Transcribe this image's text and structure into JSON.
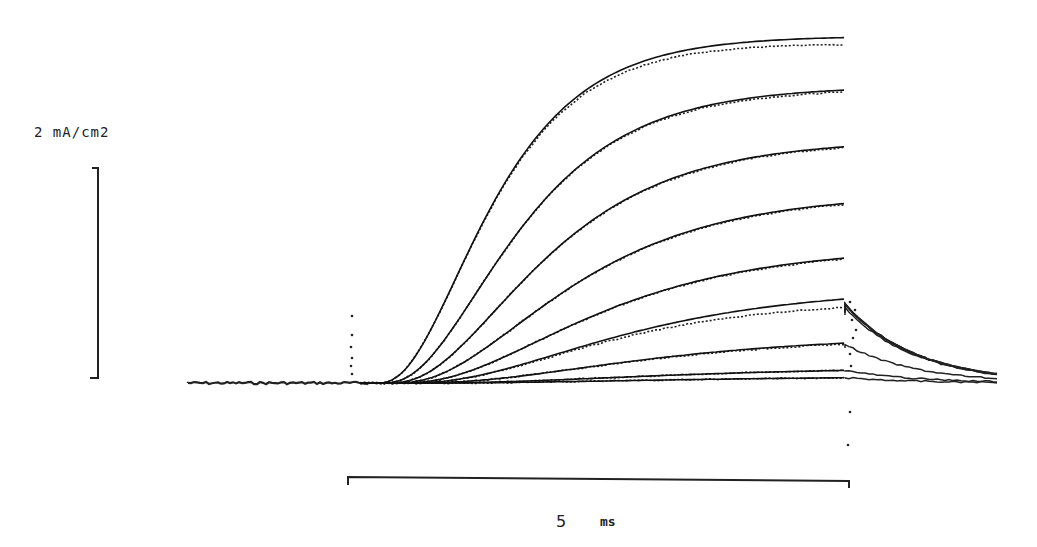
{
  "chart_data": {
    "type": "line",
    "title": "",
    "scale_bars": {
      "current": {
        "label": "2 mA/cm2",
        "value": 2,
        "unit": "mA/cm2"
      },
      "time": {
        "label": "5",
        "unit": "ms",
        "value": 5
      }
    },
    "xlabel": "time (ms)",
    "ylabel": "current (mA/cm2)",
    "xlim": [
      -1.7,
      6.4
    ],
    "ylim": [
      -0.6,
      3.4
    ],
    "step_on_ms": 0,
    "step_off_ms": 4.85,
    "series": [
      {
        "name": "trace 1",
        "final_fit": 3.29,
        "final_data": 3.22,
        "tau_ms": 1.6,
        "delay_ms": 0.15
      },
      {
        "name": "trace 2",
        "final_fit": 2.79,
        "final_data": 2.77,
        "tau_ms": 1.9,
        "delay_ms": 0.2
      },
      {
        "name": "trace 3",
        "final_fit": 2.25,
        "final_data": 2.24,
        "tau_ms": 2.2,
        "delay_ms": 0.25
      },
      {
        "name": "trace 4",
        "final_fit": 1.71,
        "final_data": 1.7,
        "tau_ms": 2.5,
        "delay_ms": 0.3
      },
      {
        "name": "trace 5",
        "final_fit": 1.19,
        "final_data": 1.18,
        "tau_ms": 2.8,
        "delay_ms": 0.35
      },
      {
        "name": "trace 6",
        "final_fit": 0.8,
        "final_data": 0.72,
        "tau_ms": 3.1,
        "delay_ms": 0.4
      },
      {
        "name": "trace 7",
        "final_fit": 0.38,
        "final_data": 0.37,
        "tau_ms": 3.4,
        "delay_ms": 0.45
      },
      {
        "name": "trace 8",
        "final_fit": 0.12,
        "final_data": 0.12,
        "tau_ms": 3.7,
        "delay_ms": 0.5
      },
      {
        "name": "trace 9",
        "final_fit": 0.05,
        "final_data": 0.05,
        "tau_ms": 4.0,
        "delay_ms": 0.5
      }
    ],
    "grid": false,
    "legend": null
  },
  "labels": {
    "current_scale": "2 mA/cm2",
    "time_value": "5",
    "time_unit": "ms"
  },
  "layout": {
    "origin_x_px": 360,
    "baseline_y_px": 383,
    "px_per_ms": 100,
    "px_per_unit": 105,
    "prestep_start_px": 188,
    "step_end_px": 845,
    "tail_end_px": 1000,
    "line_color": "#111111",
    "dot_color": "#222222"
  }
}
